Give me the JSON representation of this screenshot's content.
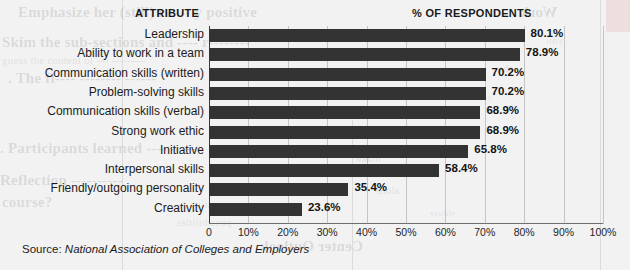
{
  "headers": {
    "attribute": "ATTRIBUTE",
    "respondents": "% OF RESPONDENTS"
  },
  "source": {
    "label": "Source:",
    "name": "National Association of Colleges and Employers"
  },
  "ghost_text": [
    "Skim the sub-sections",
    "Guess the content of",
    "The Participants learned",
    "Participants learned",
    "Reflection",
    "course?",
    "negative",
    "positive",
    "possibilities",
    "Center Outlook",
    "Work",
    "you",
    "The",
    "visible",
    "and",
    "make",
    "alone."
  ],
  "chart_data": {
    "type": "bar",
    "orientation": "horizontal",
    "title": "",
    "xlabel": "% OF RESPONDENTS",
    "ylabel": "ATTRIBUTE",
    "categories": [
      "Leadership",
      "Ability to work in a team",
      "Communication skills (written)",
      "Problem-solving skills",
      "Communication skills (verbal)",
      "Strong work ethic",
      "Initiative",
      "Interpersonal skills",
      "Friendly/outgoing personality",
      "Creativity"
    ],
    "values": [
      80.1,
      78.9,
      70.2,
      70.2,
      68.9,
      68.9,
      65.8,
      58.4,
      35.4,
      23.6
    ],
    "value_labels": [
      "80.1%",
      "78.9%",
      "70.2%",
      "70.2%",
      "68.9%",
      "68.9%",
      "65.8%",
      "58.4%",
      "35.4%",
      "23.6%"
    ],
    "xlim": [
      0,
      100
    ],
    "xticks": [
      0,
      10,
      20,
      30,
      40,
      50,
      60,
      70,
      80,
      90,
      100
    ],
    "xtick_labels": [
      "0",
      "10%",
      "20%",
      "30%",
      "40%",
      "50%",
      "60%",
      "70%",
      "80%",
      "90%",
      "100%"
    ],
    "grid": true,
    "grid_axis": "x",
    "legend": false,
    "bar_color": "#333333",
    "background_color": "#eaeaea",
    "text_color": "#1b1b1b"
  }
}
